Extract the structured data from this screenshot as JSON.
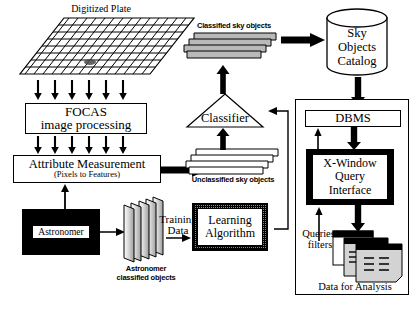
{
  "diagram": {
    "nodes": {
      "digitized_plate": "Digitized Plate",
      "focas_line1": "FOCAS",
      "focas_line2": "image processing",
      "attribute_line1": "Attribute Measurement",
      "attribute_line2": "(Pixels to Features)",
      "astronomer": "Astronomer",
      "astronomer_objects_line1": "Astronomer",
      "astronomer_objects_line2": "classified objects",
      "training_data_line1": "Training",
      "training_data_line2": "Data",
      "learning_line1": "Learning",
      "learning_line2": "Algorithm",
      "unclassified_objects": "Unclassified sky objects",
      "classifier": "Classifier",
      "classified_objects": "Classified sky objects",
      "sky_catalog_line1": "Sky",
      "sky_catalog_line2": "Objects",
      "sky_catalog_line3": "Catalog",
      "dbms": "DBMS",
      "xwindow_line1": "X-Window",
      "xwindow_line2": "Query",
      "xwindow_line3": "Interface",
      "queries_line1": "Queries/",
      "queries_line2": "filters",
      "data_for_analysis": "Data for Analysis"
    },
    "colors": {
      "stroke": "#000000",
      "background": "#ffffff",
      "sheet_fill_gray": "#b9b9b9",
      "plate_grid": "#000000"
    }
  }
}
